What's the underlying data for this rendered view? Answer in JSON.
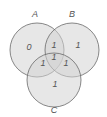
{
  "diagram": {
    "type": "venn-3",
    "fill_color": "#d6d6d6",
    "stroke_color": "#6a6a6a",
    "sets": [
      {
        "name": "A",
        "label": "A"
      },
      {
        "name": "B",
        "label": "B"
      },
      {
        "name": "C",
        "label": "C"
      }
    ],
    "regions": {
      "a_only": "0",
      "b_only": "1",
      "c_only": "1",
      "ab_only": "1",
      "ac_only": "1",
      "bc_only": "1",
      "abc": "1"
    }
  }
}
